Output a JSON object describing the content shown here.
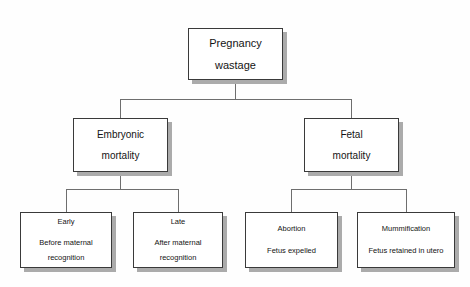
{
  "diagram": {
    "colors": {
      "background": "#fefefe",
      "box_border": "#3a3a3a",
      "box_fill": "#ffffff",
      "shadow": "#ababab",
      "connector": "#6e6e6e",
      "text": "#141414"
    },
    "root": {
      "line1": "Pregnancy",
      "line2": "wastage"
    },
    "level2": [
      {
        "line1": "Embryonic",
        "line2": "mortality"
      },
      {
        "line1": "Fetal",
        "line2": "mortality"
      }
    ],
    "level3": [
      {
        "head": "Early",
        "sub1": "Before maternal",
        "sub2": "recognition"
      },
      {
        "head": "Late",
        "sub1": "After maternal",
        "sub2": "recognition"
      },
      {
        "head": "Abortion",
        "sub1": "Fetus expelled",
        "sub2": ""
      },
      {
        "head": "Mummification",
        "sub1": "Fetus retained in utero",
        "sub2": ""
      }
    ]
  }
}
